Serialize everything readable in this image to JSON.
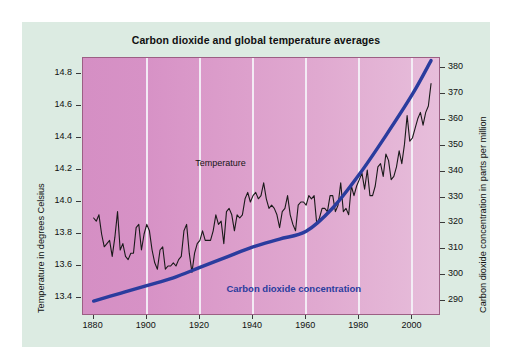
{
  "card": {
    "background_color": "#dcebe2",
    "plot_border_color": "#9c5f84"
  },
  "chart_data": {
    "type": "line",
    "title": "Carbon dioxide and global temperature averages",
    "xlabel": "",
    "x": [
      1880,
      1900,
      1920,
      1940,
      1960,
      1980,
      2000
    ],
    "xlim": [
      1876,
      2010
    ],
    "xticks": [
      "1880",
      "1900",
      "1920",
      "1940",
      "1960",
      "1980",
      "2000"
    ],
    "grid": "vertical-white-at-xticks",
    "legend": "inline-annotations",
    "axes": [
      {
        "side": "left",
        "label": "Temperature  in degrees Celsius",
        "ylim": [
          13.3,
          14.9
        ],
        "ticks": [
          "13.4",
          "13.6",
          "13.8",
          "14.0",
          "14.2",
          "14.4",
          "14.6",
          "14.8"
        ],
        "tick_values": [
          13.4,
          13.6,
          13.8,
          14.0,
          14.2,
          14.4,
          14.6,
          14.8
        ]
      },
      {
        "side": "right",
        "label": "Carbon dioxide concentration in parts per million",
        "ylim": [
          285,
          384
        ],
        "ticks": [
          "290",
          "300",
          "310",
          "320",
          "330",
          "340",
          "350",
          "360",
          "370",
          "380"
        ],
        "tick_values": [
          290,
          300,
          310,
          320,
          330,
          340,
          350,
          360,
          370,
          380
        ]
      }
    ],
    "series": [
      {
        "name": "Temperature",
        "annotation": "Temperature",
        "color": "#1a1a1a",
        "axis": "left",
        "unit": "degrees Celsius",
        "x": [
          1880,
          1881,
          1882,
          1883,
          1884,
          1885,
          1886,
          1887,
          1888,
          1889,
          1890,
          1891,
          1892,
          1893,
          1894,
          1895,
          1896,
          1897,
          1898,
          1899,
          1900,
          1901,
          1902,
          1903,
          1904,
          1905,
          1906,
          1907,
          1908,
          1909,
          1910,
          1911,
          1912,
          1913,
          1914,
          1915,
          1916,
          1917,
          1918,
          1919,
          1920,
          1921,
          1922,
          1923,
          1924,
          1925,
          1926,
          1927,
          1928,
          1929,
          1930,
          1931,
          1932,
          1933,
          1934,
          1935,
          1936,
          1937,
          1938,
          1939,
          1940,
          1941,
          1942,
          1943,
          1944,
          1945,
          1946,
          1947,
          1948,
          1949,
          1950,
          1951,
          1952,
          1953,
          1954,
          1955,
          1956,
          1957,
          1958,
          1959,
          1960,
          1961,
          1962,
          1963,
          1964,
          1965,
          1966,
          1967,
          1968,
          1969,
          1970,
          1971,
          1972,
          1973,
          1974,
          1975,
          1976,
          1977,
          1978,
          1979,
          1980,
          1981,
          1982,
          1983,
          1984,
          1985,
          1986,
          1987,
          1988,
          1989,
          1990,
          1991,
          1992,
          1993,
          1994,
          1995,
          1996,
          1997,
          1998,
          1999,
          2000,
          2001,
          2002,
          2003,
          2004,
          2005,
          2006,
          2007
        ],
        "values": [
          13.9,
          13.88,
          13.92,
          13.8,
          13.72,
          13.74,
          13.76,
          13.66,
          13.78,
          13.94,
          13.7,
          13.74,
          13.66,
          13.64,
          13.68,
          13.68,
          13.84,
          13.86,
          13.7,
          13.8,
          13.86,
          13.82,
          13.7,
          13.62,
          13.58,
          13.7,
          13.72,
          13.58,
          13.6,
          13.6,
          13.62,
          13.6,
          13.64,
          13.66,
          13.82,
          13.86,
          13.68,
          13.56,
          13.68,
          13.74,
          13.76,
          13.82,
          13.76,
          13.76,
          13.76,
          13.82,
          13.92,
          13.86,
          13.88,
          13.74,
          13.94,
          13.96,
          13.92,
          13.82,
          13.92,
          13.9,
          13.92,
          14.02,
          14.06,
          14.0,
          14.04,
          14.06,
          14.02,
          14.04,
          14.12,
          14.02,
          13.96,
          13.98,
          13.96,
          13.92,
          13.84,
          13.94,
          13.96,
          14.04,
          13.92,
          13.86,
          13.82,
          13.98,
          14.0,
          14.0,
          13.98,
          14.04,
          14.02,
          14.04,
          13.86,
          13.9,
          13.96,
          13.96,
          13.94,
          14.04,
          14.04,
          13.94,
          13.98,
          14.12,
          13.94,
          13.96,
          13.92,
          14.1,
          14.04,
          14.1,
          14.14,
          14.18,
          14.08,
          14.2,
          14.04,
          14.04,
          14.1,
          14.22,
          14.24,
          14.16,
          14.3,
          14.26,
          14.14,
          14.16,
          14.22,
          14.32,
          14.24,
          14.36,
          14.54,
          14.38,
          14.4,
          14.46,
          14.52,
          14.56,
          14.48,
          14.56,
          14.6,
          14.74
        ]
      },
      {
        "name": "Carbon dioxide concentration",
        "annotation": "Carbon dioxide concentration",
        "color": "#2a3c9e",
        "axis": "right",
        "unit": "parts per million",
        "x": [
          1880,
          1890,
          1900,
          1910,
          1920,
          1930,
          1940,
          1950,
          1960,
          1970,
          1980,
          1990,
          2000,
          2007
        ],
        "values": [
          290.0,
          293.0,
          296.0,
          299.0,
          303.0,
          307.0,
          311.0,
          314.0,
          317.0,
          326.0,
          339.0,
          354.0,
          370.0,
          383.0
        ]
      }
    ]
  }
}
